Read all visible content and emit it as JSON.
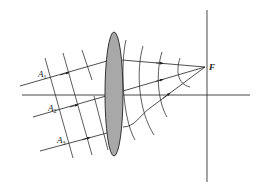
{
  "diagram": {
    "type": "optics-lens-focusing",
    "labels": {
      "a1": "A",
      "a1_sub": "1",
      "a2": "A",
      "a2_sub": "2",
      "a3": "A",
      "a3_sub": "3",
      "focus": "F"
    },
    "colors": {
      "lens_fill": "#a8a8a8",
      "lens_stroke": "#333333",
      "line": "#222222",
      "background": "#ffffff"
    }
  }
}
